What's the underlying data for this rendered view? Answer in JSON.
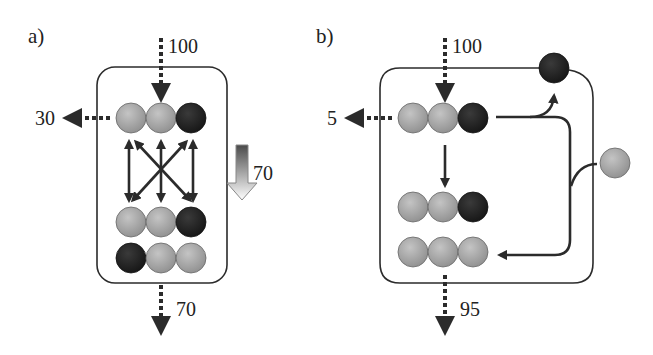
{
  "colors": {
    "stroke": "#2b2b2b",
    "light_ball": "#a9a9a9",
    "dark_ball": "#262626",
    "background": "#ffffff"
  },
  "panel_a": {
    "label": "a)",
    "input_flow": "100",
    "side_output_flow": "30",
    "bottom_output_flow": "70",
    "gradient_arrow_flow": "70",
    "rows": [
      [
        "light",
        "light",
        "dark"
      ],
      [
        "light",
        "light",
        "dark"
      ],
      [
        "dark",
        "light",
        "light"
      ]
    ]
  },
  "panel_b": {
    "label": "b)",
    "input_flow": "100",
    "side_output_flow": "5",
    "bottom_output_flow": "95",
    "rows": [
      [
        "light",
        "light",
        "dark"
      ],
      [
        "light",
        "light",
        "dark"
      ],
      [
        "light",
        "light",
        "light"
      ]
    ],
    "external_balls": [
      "dark",
      "light"
    ]
  }
}
